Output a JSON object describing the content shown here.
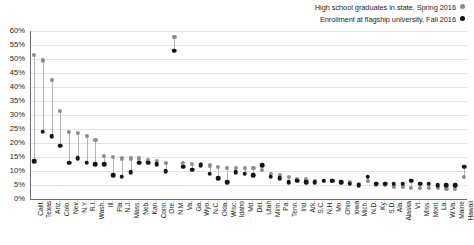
{
  "legend": {
    "position": "top-right",
    "entries": [
      {
        "label": "High school graduates in state, Spring 2016",
        "marker": "gray-dot-icon",
        "color": "#8a8a8a",
        "key": "graduates"
      },
      {
        "label": "Enrollment at flagship university, Fall 2016",
        "marker": "black-dot-icon",
        "color": "#111111",
        "key": "enrollment"
      }
    ]
  },
  "chart_data": {
    "type": "scatter",
    "title": "",
    "subtitle": "",
    "xlabel": "",
    "ylabel": "",
    "ylim": [
      0,
      60
    ],
    "ytick_values": [
      0,
      5,
      10,
      15,
      20,
      25,
      30,
      35,
      40,
      45,
      50,
      55,
      60
    ],
    "ytick_labels": [
      "0%",
      "5%",
      "10%",
      "15%",
      "20%",
      "25%",
      "30%",
      "35%",
      "40%",
      "45%",
      "50%",
      "55%",
      "60%"
    ],
    "grid": true,
    "units": "percent",
    "categories": [
      "Calif.",
      "Texas",
      "Ariz.",
      "Colo.",
      "Nev.",
      "N.Y.",
      "R.I.",
      "Wash.",
      "Ill.",
      "Fla.",
      "N.J.",
      "Mass.",
      "Neb.",
      "Kan.",
      "Conn.",
      "Ore.",
      "N.M.",
      "Va.",
      "Ga.",
      "Wyo.",
      "N.C.",
      "Okla.",
      "Wisc.",
      "Idaho",
      "Md.",
      "Del.",
      "Utah",
      "Minn.",
      "Pa.",
      "Tenn.",
      "Ind.",
      "Ark.",
      "S.C.",
      "N.H.",
      "Mo.",
      "Ohio",
      "Iowa",
      "Mich.",
      "N.D.",
      "Ky.",
      "S.D.",
      "Ala.",
      "Alaska",
      "Vt.",
      "Miss.",
      "Mont.",
      "La.",
      "W.Va.",
      "Maine",
      "Hawaii"
    ],
    "series": [
      {
        "name": "High school graduates in state, Spring 2016",
        "key": "graduates",
        "color": "#8d8d8d",
        "values": [
          51.5,
          49.5,
          42.5,
          31.5,
          24.0,
          23.5,
          22.5,
          21.0,
          15.5,
          15.0,
          14.5,
          14.5,
          14.5,
          14.0,
          13.5,
          13.0,
          58.0,
          13.0,
          12.5,
          12.5,
          12.0,
          11.5,
          11.0,
          11.0,
          11.0,
          11.0,
          10.5,
          9.0,
          8.5,
          8.0,
          7.0,
          7.0,
          6.5,
          6.5,
          6.5,
          6.0,
          6.0,
          5.5,
          6.5,
          5.0,
          5.0,
          4.5,
          4.5,
          4.0,
          4.0,
          4.0,
          4.0,
          3.5,
          3.5,
          8.0
        ]
      },
      {
        "name": "Enrollment at flagship university, Fall 2016",
        "key": "enrollment",
        "color": "#141414",
        "values": [
          13.5,
          24.0,
          22.5,
          19.0,
          13.0,
          14.5,
          13.0,
          12.5,
          12.5,
          8.5,
          8.0,
          9.5,
          13.0,
          13.0,
          12.5,
          10.0,
          53.0,
          11.5,
          10.5,
          12.0,
          9.0,
          7.5,
          6.0,
          9.5,
          9.0,
          8.5,
          12.0,
          8.0,
          7.5,
          6.0,
          6.5,
          6.0,
          6.0,
          6.5,
          6.5,
          6.0,
          5.5,
          5.0,
          8.0,
          5.5,
          5.5,
          5.5,
          5.5,
          6.5,
          5.5,
          5.5,
          5.0,
          5.0,
          5.0,
          11.5
        ]
      }
    ]
  }
}
